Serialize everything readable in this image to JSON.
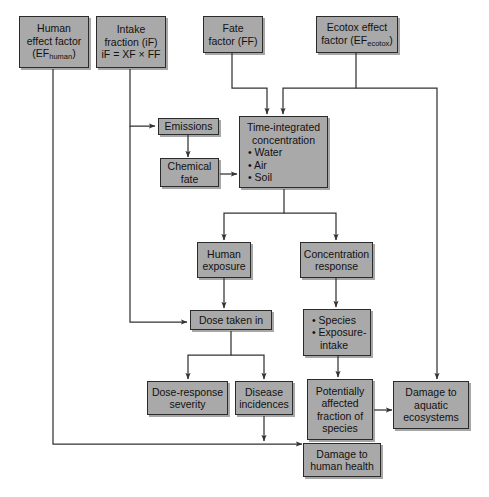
{
  "diagram": {
    "type": "flowchart",
    "background_color": "#ffffff",
    "box_fill_color": "#a9a9a9",
    "box_border_color": "#2b2b2b",
    "line_color": "#333333",
    "nodes": [
      {
        "id": "human-effect-factor",
        "lines": [
          "Human",
          "effect factor",
          "(EF"
        ],
        "subscript": "human",
        "tail": ")"
      },
      {
        "id": "intake-fraction",
        "lines": [
          "Intake",
          "fraction (iF)",
          "iF = XF × FF"
        ]
      },
      {
        "id": "fate-factor",
        "lines": [
          "Fate",
          "factor (FF)"
        ]
      },
      {
        "id": "ecotox-effect-factor",
        "lines": [
          "Ecotox effect",
          "factor (EF"
        ],
        "subscript": "ecotox",
        "tail": ")"
      },
      {
        "id": "emissions",
        "lines": [
          "Emissions"
        ]
      },
      {
        "id": "chemical-fate",
        "lines": [
          "Chemical",
          "fate"
        ]
      },
      {
        "id": "time-integrated-concentration",
        "header": [
          "Time-integrated",
          "concentration"
        ],
        "bullets": [
          "• Water",
          "• Air",
          "• Soil"
        ]
      },
      {
        "id": "human-exposure",
        "lines": [
          "Human",
          "exposure"
        ]
      },
      {
        "id": "concentration-response",
        "lines": [
          "Concentration",
          "response"
        ]
      },
      {
        "id": "dose-taken-in",
        "lines": [
          "Dose taken in"
        ]
      },
      {
        "id": "species-exposure-intake",
        "bullets": [
          "• Species",
          "• Exposure-",
          "intake"
        ]
      },
      {
        "id": "dose-response-severity",
        "lines": [
          "Dose-response",
          "severity"
        ]
      },
      {
        "id": "disease-incidences",
        "lines": [
          "Disease",
          "incidences"
        ]
      },
      {
        "id": "potentially-affected-fraction",
        "lines": [
          "Potentially",
          "affected",
          "fraction of",
          "species"
        ]
      },
      {
        "id": "damage-to-aquatic-ecosystems",
        "lines": [
          "Damage to",
          "aquatic",
          "ecosystems"
        ]
      },
      {
        "id": "damage-to-human-health",
        "lines": [
          "Damage to",
          "human health"
        ]
      }
    ],
    "edges": [
      {
        "from": "human-effect-factor",
        "to": "damage-to-human-health"
      },
      {
        "from": "intake-fraction",
        "to": "dose-taken-in"
      },
      {
        "from": "intake-fraction",
        "to": "emissions"
      },
      {
        "from": "fate-factor",
        "to": "time-integrated-concentration"
      },
      {
        "from": "ecotox-effect-factor",
        "to": "time-integrated-concentration"
      },
      {
        "from": "ecotox-effect-factor",
        "to": "damage-to-aquatic-ecosystems"
      },
      {
        "from": "emissions",
        "to": "chemical-fate"
      },
      {
        "from": "chemical-fate",
        "to": "time-integrated-concentration"
      },
      {
        "from": "time-integrated-concentration",
        "to": "human-exposure"
      },
      {
        "from": "time-integrated-concentration",
        "to": "concentration-response"
      },
      {
        "from": "human-exposure",
        "to": "dose-taken-in"
      },
      {
        "from": "concentration-response",
        "to": "species-exposure-intake"
      },
      {
        "from": "dose-taken-in",
        "to": "dose-response-severity"
      },
      {
        "from": "dose-taken-in",
        "to": "disease-incidences"
      },
      {
        "from": "species-exposure-intake",
        "to": "potentially-affected-fraction"
      },
      {
        "from": "disease-incidences",
        "to": "damage-to-human-health"
      },
      {
        "from": "potentially-affected-fraction",
        "to": "damage-to-aquatic-ecosystems"
      }
    ]
  }
}
